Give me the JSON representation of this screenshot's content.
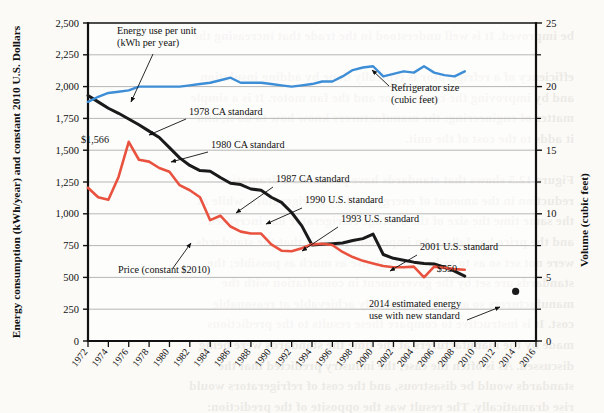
{
  "page": {
    "background_color": "#fbfaf7",
    "bleed_text": "be improved. It is well understood in the trade that increasing the\n\nefficiency of a refrigerator is typically done by adding insulation\nand by improving the compressor and the fan motor. It is a simple\nmatter of engineering: the manufacturers know how to do it, and\nit adds to the cost of the unit.\n\nFigure 12.5 shows that standards have produced a dramatic\nreduction in the amount of energy used by refrigerators, while at\nthe same time the size of the average refrigerator has increased\nand the price has fallen. An important point is that the standards\nwere not set so as to reduce energy use as much as possible; the\nstandards are set by the government in consultation with the\nmanufacturers so as to be technically achievable at reasonable\ncost. It is instructive to compare these results to the predictions\nmade by the manufacturers at the time the standards were being\ndiscussed. As is often the case, the industry predicted that the\nstandards would be disastrous, and the cost of refrigerators would\nrise dramatically. The result was the opposite of the prediction:\nenergy use fell, size increased, and price fell.\n\nOne of the reasons that standards are so effective is that they\naddress the problem of the split incentive, which is a significant\nbarrier to energy efficiency. The split incentive arises when the\nperson who pays for the appliance is not the person who pays for\nthe energy it consumes. A classic example is the landlord who\nbuys the refrigerator for a rental unit: the landlord has no incentive\nto buy a more efficient, more expensive unit because the tenant\npays the electric bill. Standards solve this problem by removing\nthe inefficient models from the market altogether."
  },
  "chart_data": {
    "type": "line",
    "title": "",
    "xlabel": "",
    "ylabel_left": "Energy consumption (kWh/year) and constant 2010 U.S. Dollars",
    "ylabel_right": "Volume (cubic feet)",
    "grid": true,
    "legend_position": "none",
    "xlim": [
      1972,
      2016
    ],
    "x_tick_labels": [
      "1972",
      "1974",
      "1976",
      "1978",
      "1980",
      "1982",
      "1984",
      "1986",
      "1988",
      "1990",
      "1992",
      "1994",
      "1996",
      "1998",
      "2000",
      "2002",
      "2004",
      "2006",
      "2008",
      "2010",
      "2012",
      "2014",
      "2016"
    ],
    "ylim_left": [
      0,
      2500
    ],
    "y_tick_labels_left": [
      "0",
      "250",
      "500",
      "750",
      "1,000",
      "1,250",
      "1,500",
      "1,750",
      "2,000",
      "2,250",
      "2,500"
    ],
    "ylim_right": [
      0,
      25
    ],
    "y_tick_labels_right": [
      "0",
      "5",
      "10",
      "15",
      "20",
      "25"
    ],
    "y_tick_minor_right": [
      2.5,
      7.5,
      12.5,
      17.5,
      22.5
    ],
    "series": [
      {
        "name": "Energy use per unit (kWh per year)",
        "color": "#1a1a1a",
        "axis": "left",
        "x": [
          1972,
          1973,
          1974,
          1975,
          1976,
          1977,
          1978,
          1979,
          1980,
          1981,
          1982,
          1983,
          1984,
          1985,
          1986,
          1987,
          1988,
          1989,
          1990,
          1991,
          1992,
          1993,
          1994,
          1995,
          1996,
          1997,
          1998,
          1999,
          2000,
          2001,
          2002,
          2003,
          2004,
          2005,
          2006,
          2007,
          2008,
          2009
        ],
        "values": [
          1930,
          1880,
          1830,
          1790,
          1745,
          1700,
          1650,
          1600,
          1520,
          1440,
          1380,
          1340,
          1335,
          1285,
          1240,
          1230,
          1195,
          1185,
          1130,
          1090,
          1010,
          905,
          755,
          760,
          765,
          770,
          790,
          805,
          840,
          680,
          650,
          635,
          620,
          610,
          605,
          580,
          550,
          510
        ]
      },
      {
        "name": "Price (constant $2010)",
        "color": "#e8523f",
        "axis": "left",
        "x": [
          1972,
          1973,
          1974,
          1975,
          1976,
          1977,
          1978,
          1979,
          1980,
          1981,
          1982,
          1983,
          1984,
          1985,
          1986,
          1987,
          1988,
          1989,
          1990,
          1991,
          1992,
          1993,
          1994,
          1995,
          1996,
          1997,
          1998,
          1999,
          2000,
          2001,
          2002,
          2003,
          2004,
          2005,
          2006,
          2007,
          2008,
          2009
        ],
        "values": [
          1205,
          1130,
          1110,
          1290,
          1566,
          1425,
          1410,
          1360,
          1330,
          1225,
          1185,
          1130,
          950,
          985,
          900,
          860,
          845,
          845,
          760,
          710,
          705,
          730,
          760,
          765,
          755,
          700,
          660,
          630,
          610,
          590,
          580,
          580,
          585,
          500,
          585,
          575,
          565,
          560
        ]
      },
      {
        "name": "Refrigerator size (cubic feet)",
        "color": "#3d8ed6",
        "axis": "right",
        "x": [
          1972,
          1973,
          1974,
          1975,
          1976,
          1977,
          1978,
          1979,
          1980,
          1981,
          1982,
          1983,
          1984,
          1985,
          1986,
          1987,
          1988,
          1989,
          1990,
          1991,
          1992,
          1993,
          1994,
          1995,
          1996,
          1997,
          1998,
          1999,
          2000,
          2001,
          2002,
          2003,
          2004,
          2005,
          2006,
          2007,
          2008,
          2009
        ],
        "values": [
          18.8,
          19.2,
          19.5,
          19.6,
          19.7,
          20.0,
          20.0,
          20.0,
          20.0,
          20.0,
          20.1,
          20.2,
          20.3,
          20.5,
          20.7,
          20.3,
          20.3,
          20.3,
          20.2,
          20.1,
          20.0,
          20.1,
          20.2,
          20.4,
          20.4,
          20.8,
          21.3,
          21.5,
          21.6,
          20.8,
          21.0,
          21.2,
          21.1,
          21.6,
          21.1,
          20.9,
          20.8,
          21.2
        ]
      },
      {
        "name": "2014 estimated energy use with new standard",
        "color": "#1a1a1a",
        "axis": "left",
        "type": "point",
        "x": [
          2014
        ],
        "values": [
          390
        ]
      }
    ],
    "annotations": [
      {
        "name": "energy-use-per-unit",
        "text_lines": [
          "Energy use per unit",
          "(kWh per year)"
        ],
        "text_x": 117,
        "text_y": 34,
        "align": "start",
        "arrow": {
          "x1": 153,
          "y1": 54,
          "x2": 131,
          "y2": 102
        }
      },
      {
        "name": "refrigerator-size",
        "text_lines": [
          "Refrigerator size",
          "(cubic feet)"
        ],
        "text_x": 391,
        "text_y": 91,
        "align": "start",
        "arrow": {
          "x1": 389,
          "y1": 86,
          "x2": 372,
          "y2": 70
        }
      },
      {
        "name": "1978-ca-standard",
        "text_lines": [
          "1978 CA standard"
        ],
        "text_x": 189,
        "text_y": 115,
        "align": "start",
        "arrow": {
          "x1": 186,
          "y1": 119,
          "x2": 149,
          "y2": 135
        }
      },
      {
        "name": "1980-ca-standard",
        "text_lines": [
          "1980 CA standard"
        ],
        "text_x": 211,
        "text_y": 148,
        "align": "start",
        "arrow": {
          "x1": 208,
          "y1": 152,
          "x2": 171,
          "y2": 162
        }
      },
      {
        "name": "1987-ca-standard",
        "text_lines": [
          "1987 CA standard"
        ],
        "text_x": 276,
        "text_y": 182,
        "align": "start",
        "arrow": {
          "x1": 273,
          "y1": 187,
          "x2": 236,
          "y2": 213
        }
      },
      {
        "name": "1990-us-standard",
        "text_lines": [
          "1990 U.S. standard"
        ],
        "text_x": 305,
        "text_y": 203,
        "align": "start",
        "arrow": {
          "x1": 302,
          "y1": 208,
          "x2": 266,
          "y2": 224
        }
      },
      {
        "name": "1993-us-standard",
        "text_lines": [
          "1993 U.S. standard"
        ],
        "text_x": 341,
        "text_y": 222,
        "align": "start",
        "arrow": {
          "x1": 338,
          "y1": 227,
          "x2": 302,
          "y2": 251
        }
      },
      {
        "name": "2001-us-standard",
        "text_lines": [
          "2001 U.S. standard"
        ],
        "text_x": 420,
        "text_y": 250,
        "align": "start",
        "arrow": {
          "x1": 417,
          "y1": 255,
          "x2": 390,
          "y2": 271
        }
      },
      {
        "name": "2014-estimated-energy-use",
        "text_lines": [
          "2014 estimated energy",
          "use with new standard"
        ],
        "text_x": 369,
        "text_y": 307,
        "align": "start",
        "arrow": {
          "x1": 467,
          "y1": 320,
          "x2": 500,
          "y2": 307
        }
      },
      {
        "name": "price-constant-2010",
        "text_lines": [
          "Price (constant $2010)"
        ],
        "text_x": 118,
        "text_y": 273,
        "align": "start",
        "arrow": {
          "x1": 173,
          "y1": 268,
          "x2": 191,
          "y2": 243
        }
      }
    ],
    "value_labels": [
      {
        "name": "price-peak-label",
        "text": "$1,566",
        "x": 95,
        "y": 143
      },
      {
        "name": "price-end-label",
        "text": "$550",
        "x": 447,
        "y": 272
      }
    ]
  }
}
